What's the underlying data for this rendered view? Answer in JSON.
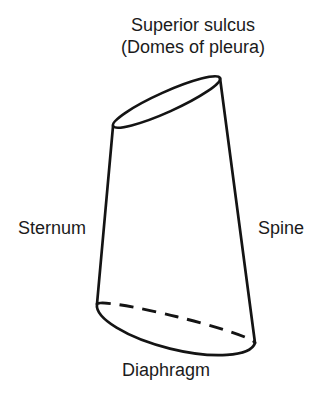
{
  "figure": {
    "title": {
      "line1": "Superior sulcus",
      "line2": "(Domes of pleura)"
    },
    "labels": {
      "sternum": "Sternum",
      "spine": "Spine",
      "diaphragm": "Diaphragm"
    },
    "colors": {
      "background": "#ffffff",
      "line": "#141414",
      "text": "#1b1b1b"
    }
  }
}
